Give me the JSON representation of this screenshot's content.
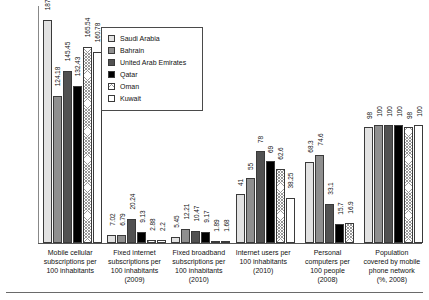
{
  "legend": {
    "position": "top-center-inset",
    "entries": [
      {
        "label": "Saudi Arabia",
        "color": "#e2e2e2",
        "fill": "solid-light-gray"
      },
      {
        "label": "Bahrain",
        "color": "#8f8f8f",
        "fill": "solid-medium-gray"
      },
      {
        "label": "United Arab Emirates",
        "color": "#515151",
        "fill": "solid-dark-gray"
      },
      {
        "label": "Qatar",
        "color": "#000000",
        "fill": "solid-black"
      },
      {
        "label": "Oman",
        "color": "#ffffff",
        "fill": "cross-hatch"
      },
      {
        "label": "Kuwait",
        "color": "#ffffff",
        "fill": "solid-white"
      }
    ]
  },
  "chart_data": {
    "type": "bar",
    "title": "",
    "subtitle": "",
    "xlabel": "",
    "ylabel": "",
    "grid": false,
    "axis_visible": true,
    "ylim": [
      0,
      200
    ],
    "categories": [
      "Mobile cellular subscriptions per 100 inhabitants",
      "Fixed internet subscriptions per 100 inhabitants (2009)",
      "Fixed broadband subscriptions per 100 inhabitants (2010)",
      "Internet users per 100 inhabitants (2010)",
      "Personal computers per 100 people (2008)",
      "Population covered by mobile phone network (%, 2008)"
    ],
    "category_lines": [
      [
        "Mobile cellular",
        "subscriptions per",
        "100 inhabitants"
      ],
      [
        "Fixed internet",
        "subscriptions per",
        "100 inhabitants",
        "(2009)"
      ],
      [
        "Fixed broadband",
        "subscriptions per",
        "100 inhabitants",
        "(2010)"
      ],
      [
        "Internet users per",
        "100 inhabitants",
        "(2010)"
      ],
      [
        "Personal",
        "computers per",
        "100 people",
        "(2008)"
      ],
      [
        "Population",
        "covered by mobile",
        "phone network",
        "(%, 2008)"
      ]
    ],
    "series": [
      {
        "name": "Saudi Arabia",
        "values": [
          187.86,
          7.02,
          5.45,
          41,
          68.3,
          98
        ]
      },
      {
        "name": "Bahrain",
        "values": [
          124.18,
          6.79,
          12.21,
          55,
          74.6,
          100
        ]
      },
      {
        "name": "United Arab Emirates",
        "values": [
          145.45,
          20.24,
          10.47,
          78,
          33.1,
          100
        ]
      },
      {
        "name": "Qatar",
        "values": [
          132.43,
          9.13,
          9.17,
          69,
          15.7,
          100
        ]
      },
      {
        "name": "Oman",
        "values": [
          165.54,
          2.88,
          1.89,
          62.6,
          16.9,
          98
        ]
      },
      {
        "name": "Kuwait",
        "values": [
          160.78,
          2.2,
          1.68,
          38.25,
          null,
          100
        ]
      }
    ],
    "labels": [
      [
        "187.86",
        "124.18",
        "145.45",
        "132.43",
        "165.54",
        "160.78"
      ],
      [
        "7.02",
        "6.79",
        "20.24",
        "9.13",
        "2.88",
        "2.2"
      ],
      [
        "5.45",
        "12.21",
        "10.47",
        "9.17",
        "1.89",
        "1.68"
      ],
      [
        "41",
        "55",
        "78",
        "69",
        "62.6",
        "38.25"
      ],
      [
        "68.3",
        "74.6",
        "33.1",
        "15.7",
        "16.9",
        ""
      ],
      [
        "98",
        "100",
        "100",
        "100",
        "98",
        "100"
      ]
    ]
  }
}
